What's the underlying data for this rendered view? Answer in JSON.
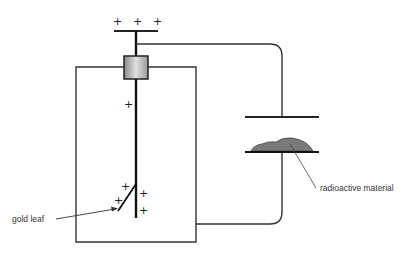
{
  "diagram": {
    "labels": {
      "gold_leaf": "gold leaf",
      "radioactive_material": "radioactive material"
    },
    "charges": {
      "top_plate": [
        "+",
        "+",
        "+"
      ],
      "rod": [
        "+"
      ],
      "leaf_area": [
        "+",
        "+",
        "+",
        "+"
      ]
    },
    "colors": {
      "line": "#222222",
      "insulator_light": "#d8d8d8",
      "insulator_dark": "#8a8a8a",
      "radioactive_fill": "#7a7a7a"
    }
  }
}
